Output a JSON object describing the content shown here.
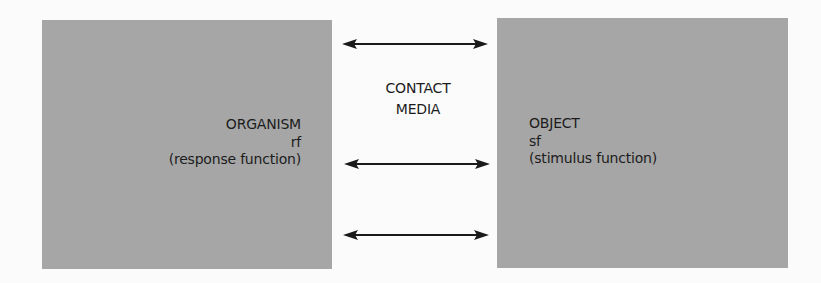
{
  "diagram": {
    "left_box": {
      "title": "ORGANISM",
      "abbrev": "rf",
      "description": "(response function)",
      "fill": "#a6a6a6"
    },
    "right_box": {
      "title": "OBJECT",
      "abbrev": "sf",
      "description": "(stimulus function)",
      "fill": "#a6a6a6"
    },
    "middle": {
      "line1": "CONTACT",
      "line2": "MEDIA"
    },
    "arrows": [
      {
        "type": "bidirectional",
        "y": 44
      },
      {
        "type": "bidirectional",
        "y": 164
      },
      {
        "type": "bidirectional",
        "y": 235
      }
    ],
    "colors": {
      "background": "#fbfbfb",
      "box": "#a6a6a6",
      "text": "#1c1c1c",
      "arrow": "#1a1a1a"
    }
  }
}
